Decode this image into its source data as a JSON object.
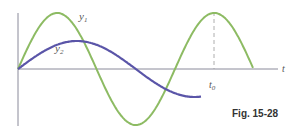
{
  "figure": {
    "caption": "Fig. 15-28",
    "axis_label_t": "t",
    "curve_labels": {
      "y1": "y",
      "y1_sub": "1",
      "y2": "y",
      "y2_sub": "2"
    },
    "marker_label": "t",
    "marker_sub": "0",
    "colors": {
      "y1": "#8dbb63",
      "y2": "#5a55a8",
      "axis": "#8a8a9a",
      "dashed": "#999999"
    }
  },
  "chart_data": {
    "type": "line",
    "title": "",
    "xlabel": "t",
    "ylabel": "",
    "grid": false,
    "series": [
      {
        "name": "y1",
        "description": "sinusoid, larger amplitude, shorter period",
        "amplitude": 1.0,
        "relative_period": 1.0,
        "phase": 0,
        "x_range_periods": [
          0,
          1.5
        ]
      },
      {
        "name": "y2",
        "description": "sinusoid, smaller amplitude, longer period",
        "amplitude": 0.5,
        "relative_period": 1.5,
        "phase": 0,
        "x_range_periods": [
          0,
          1.17
        ]
      }
    ],
    "annotations": [
      {
        "text": "t0",
        "description": "dashed vertical line where y1 is at maximum and y2 crosses zero going upward"
      }
    ]
  }
}
